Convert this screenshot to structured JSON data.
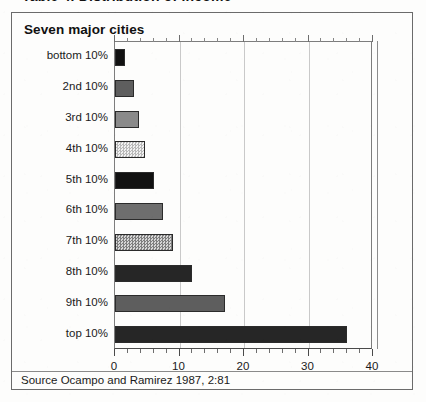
{
  "caption_cut_off": "Table 4. Distribution of income",
  "figure": {
    "title": "Seven major cities",
    "source": "Source Ocampo and Ramirez 1987, 2:81"
  },
  "chart_data": {
    "type": "bar",
    "orientation": "horizontal",
    "title": "Seven major cities",
    "xlabel": "",
    "ylabel": "",
    "xlim": [
      0,
      40
    ],
    "xticks": [
      0,
      10,
      20,
      30,
      40
    ],
    "xtick_labels": [
      "0",
      "10",
      "20",
      "30",
      "40"
    ],
    "minor_tick_step": 2,
    "grid": "vertical",
    "legend": "none",
    "categories": [
      "bottom 10%",
      "2nd 10%",
      "3rd 10%",
      "4th 10%",
      "5th 10%",
      "6th 10%",
      "7th 10%",
      "8th 10%",
      "9th 10%",
      "top 10%"
    ],
    "values": [
      1.5,
      3.0,
      3.7,
      4.6,
      6.0,
      7.5,
      9.0,
      12.0,
      17.0,
      36.0
    ],
    "bar_fills": [
      "solid-black",
      "solid-dark-gray",
      "solid-mid-gray",
      "checker-light",
      "solid-black",
      "solid-gray",
      "checker-mid",
      "solid-near-black",
      "solid-dark-gray",
      "solid-near-black"
    ],
    "colors": {
      "solid_black": "#111111",
      "solid_near_black": "#262626",
      "solid_dark_gray": "#5e5e5e",
      "solid_gray": "#6e6e6e",
      "solid_mid_gray": "#8a8a8a",
      "checker_light": "#cfcfcf",
      "checker_mid": "#a0a0a0",
      "bar_outline": "#2b2b2b",
      "grid": "#c9c9c9",
      "frame": "#7d7d7d"
    }
  }
}
